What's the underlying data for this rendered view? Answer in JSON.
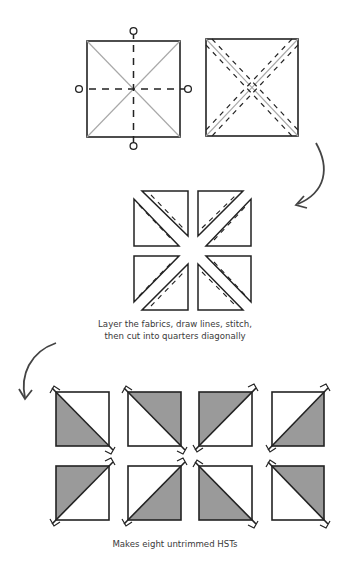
{
  "colors": {
    "line": "#222222",
    "diagonal": "#a8a8a8",
    "shade": "#9a9a9a",
    "arrow": "#444444",
    "caption": "#3a3a3a"
  },
  "step1": {
    "left_square": "square-with-diagonals-and-quarter-marks",
    "right_square": "square-with-diagonals-and-stitch-lines"
  },
  "step2": {
    "caption_line1": "Layer the fabrics, draw lines, stitch,",
    "caption_line2": "then cut into quarters diagonally",
    "pieces": 8
  },
  "step3": {
    "caption": "Makes eight untrimmed HSTs",
    "hst_count": 8
  },
  "arrows": [
    "curved-arrow-right-down",
    "curved-arrow-left-down"
  ]
}
